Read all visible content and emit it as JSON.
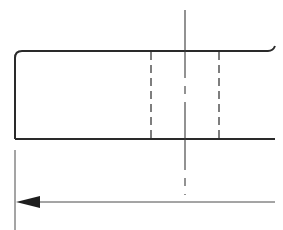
{
  "drawing": {
    "type": "technical-section-view",
    "stroke_color": "#2a2a2a",
    "thin_color": "#4a4a4a",
    "background": "#ffffff",
    "outline": {
      "top_y": 51,
      "bottom_y": 139,
      "left_x": 15,
      "right_x": 275,
      "corner_chamfer": 6
    },
    "hidden_lines": [
      {
        "x": 151,
        "y1": 51,
        "y2": 139
      },
      {
        "x": 219,
        "y1": 51,
        "y2": 139
      }
    ],
    "center_line": {
      "x": 185,
      "y1": 10,
      "y2": 195
    },
    "extension_line": {
      "x": 15,
      "y1": 150,
      "y2": 230
    },
    "dimension_line": {
      "y": 202,
      "x1": 15,
      "x2": 275,
      "arrow": "left"
    }
  }
}
